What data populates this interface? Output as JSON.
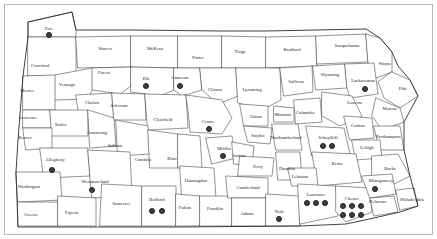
{
  "map": {
    "title": "Pennsylvania County Map",
    "region": "Pennsylvania",
    "dot_color": "#3f3f3f",
    "border_color": "#3a3a3a",
    "background_color": "#ffffff",
    "frame_color": "#b8b8b8",
    "label_color": "#1a1a1a"
  },
  "legend": {
    "dot_meaning": "site marker"
  },
  "chart_data": {
    "type": "map",
    "marker_symbol": "filled-circle",
    "total_markers": 23,
    "counties": [
      {
        "name": "Erie",
        "label_x": 49,
        "label_y": 28,
        "dots": 1
      },
      {
        "name": "Crawford",
        "label_x": 40,
        "label_y": 65,
        "dots": 0
      },
      {
        "name": "Warren",
        "label_x": 105,
        "label_y": 48,
        "dots": 0
      },
      {
        "name": "McKean",
        "label_x": 155,
        "label_y": 48,
        "dots": 0
      },
      {
        "name": "Potter",
        "label_x": 198,
        "label_y": 57,
        "dots": 0
      },
      {
        "name": "Tioga",
        "label_x": 240,
        "label_y": 51,
        "dots": 0
      },
      {
        "name": "Bradford",
        "label_x": 292,
        "label_y": 49,
        "dots": 0
      },
      {
        "name": "Susquehanna",
        "label_x": 347,
        "label_y": 45,
        "dots": 0
      },
      {
        "name": "Wayne",
        "label_x": 385,
        "label_y": 63,
        "dots": 0
      },
      {
        "name": "Mercer",
        "label_x": 27,
        "label_y": 90,
        "dots": 0
      },
      {
        "name": "Venango",
        "label_x": 67,
        "label_y": 84,
        "dots": 0
      },
      {
        "name": "Forest",
        "label_x": 104,
        "label_y": 72,
        "dots": 0
      },
      {
        "name": "Elk",
        "label_x": 146,
        "label_y": 78,
        "dots": 1
      },
      {
        "name": "Cameron",
        "label_x": 180,
        "label_y": 77,
        "dots": 1
      },
      {
        "name": "Clinton",
        "label_x": 215,
        "label_y": 89,
        "dots": 0
      },
      {
        "name": "Lycoming",
        "label_x": 252,
        "label_y": 89,
        "dots": 0
      },
      {
        "name": "Sullivan",
        "label_x": 296,
        "label_y": 81,
        "dots": 0
      },
      {
        "name": "Wyoming",
        "label_x": 330,
        "label_y": 74,
        "dots": 0
      },
      {
        "name": "Lackawanna",
        "label_x": 363,
        "label_y": 80,
        "dots": 1
      },
      {
        "name": "Pike",
        "label_x": 403,
        "label_y": 88,
        "dots": 0
      },
      {
        "name": "Lawrence",
        "label_x": 28,
        "label_y": 117,
        "dots": 0
      },
      {
        "name": "Clarion",
        "label_x": 92,
        "label_y": 102,
        "dots": 0
      },
      {
        "name": "Jefferson",
        "label_x": 119,
        "label_y": 105,
        "dots": 0
      },
      {
        "name": "Clearfield",
        "label_x": 163,
        "label_y": 119,
        "dots": 0
      },
      {
        "name": "Centre",
        "label_x": 208,
        "label_y": 121,
        "dots": 1
      },
      {
        "name": "Union",
        "label_x": 256,
        "label_y": 116,
        "dots": 0
      },
      {
        "name": "Montour",
        "label_x": 283,
        "label_y": 114,
        "dots": 0
      },
      {
        "name": "Columbia",
        "label_x": 305,
        "label_y": 112,
        "dots": 0
      },
      {
        "name": "Luzerne",
        "label_x": 355,
        "label_y": 102,
        "dots": 0
      },
      {
        "name": "Monroe",
        "label_x": 390,
        "label_y": 108,
        "dots": 0
      },
      {
        "name": "Butler",
        "label_x": 61,
        "label_y": 124,
        "dots": 0
      },
      {
        "name": "Armstrong",
        "label_x": 97,
        "label_y": 132,
        "dots": 0
      },
      {
        "name": "Beaver",
        "label_x": 25,
        "label_y": 137,
        "dots": 0
      },
      {
        "name": "Indiana",
        "label_x": 115,
        "label_y": 145,
        "dots": 0
      },
      {
        "name": "Cambria",
        "label_x": 143,
        "label_y": 159,
        "dots": 0
      },
      {
        "name": "Blair",
        "label_x": 172,
        "label_y": 158,
        "dots": 0
      },
      {
        "name": "Mifflin",
        "label_x": 224,
        "label_y": 148,
        "dots": 1
      },
      {
        "name": "Juniata",
        "label_x": 239,
        "label_y": 155,
        "dots": 0
      },
      {
        "name": "Snyder",
        "label_x": 258,
        "label_y": 135,
        "dots": 0
      },
      {
        "name": "Northumberland",
        "label_x": 286,
        "label_y": 137,
        "dots": 0
      },
      {
        "name": "Schuylkill",
        "label_x": 328,
        "label_y": 137,
        "dots": 2
      },
      {
        "name": "Carbon",
        "label_x": 358,
        "label_y": 125,
        "dots": 0
      },
      {
        "name": "Northampton",
        "label_x": 388,
        "label_y": 136,
        "dots": 0
      },
      {
        "name": "Lehigh",
        "label_x": 367,
        "label_y": 147,
        "dots": 0
      },
      {
        "name": "Berks",
        "label_x": 337,
        "label_y": 163,
        "dots": 0
      },
      {
        "name": "Bucks",
        "label_x": 390,
        "label_y": 168,
        "dots": 0
      },
      {
        "name": "Allegheny",
        "label_x": 55,
        "label_y": 159,
        "dots": 1
      },
      {
        "name": "Westmoreland",
        "label_x": 95,
        "label_y": 181,
        "dots": 1
      },
      {
        "name": "Washington",
        "label_x": 29,
        "label_y": 186,
        "dots": 0
      },
      {
        "name": "Greene",
        "label_x": 31,
        "label_y": 214,
        "dots": 0
      },
      {
        "name": "Fayette",
        "label_x": 72,
        "label_y": 212,
        "dots": 0
      },
      {
        "name": "Somerset",
        "label_x": 121,
        "label_y": 203,
        "dots": 0
      },
      {
        "name": "Bedford",
        "label_x": 157,
        "label_y": 199,
        "dots": 2
      },
      {
        "name": "Huntingdon",
        "label_x": 196,
        "label_y": 180,
        "dots": 0
      },
      {
        "name": "Fulton",
        "label_x": 185,
        "label_y": 207,
        "dots": 0
      },
      {
        "name": "Franklin",
        "label_x": 215,
        "label_y": 208,
        "dots": 0
      },
      {
        "name": "Cumberland",
        "label_x": 248,
        "label_y": 187,
        "dots": 0
      },
      {
        "name": "Perry",
        "label_x": 258,
        "label_y": 166,
        "dots": 0
      },
      {
        "name": "Dauphin",
        "label_x": 287,
        "label_y": 168,
        "dots": 0
      },
      {
        "name": "Lebanon",
        "label_x": 300,
        "label_y": 176,
        "dots": 0
      },
      {
        "name": "Adams",
        "label_x": 247,
        "label_y": 213,
        "dots": 0
      },
      {
        "name": "York",
        "label_x": 279,
        "label_y": 211,
        "dots": 1
      },
      {
        "name": "Lancaster",
        "label_x": 316,
        "label_y": 194,
        "dots": 3
      },
      {
        "name": "Chester",
        "label_x": 352,
        "label_y": 198,
        "dots": 6
      },
      {
        "name": "Montgomery",
        "label_x": 381,
        "label_y": 180,
        "dots": 1
      },
      {
        "name": "Delaware",
        "label_x": 378,
        "label_y": 201,
        "dots": 0
      },
      {
        "name": "Philadelphia",
        "label_x": 412,
        "label_y": 199,
        "dots": 0
      }
    ],
    "markers": [
      {
        "county": "Erie",
        "x": 49,
        "y": 35
      },
      {
        "county": "Elk",
        "x": 146,
        "y": 86
      },
      {
        "county": "Cameron",
        "x": 180,
        "y": 86
      },
      {
        "county": "Lackawanna",
        "x": 365,
        "y": 89
      },
      {
        "county": "Centre",
        "x": 209,
        "y": 129
      },
      {
        "county": "Mifflin",
        "x": 223,
        "y": 156
      },
      {
        "county": "Schuylkill",
        "x": 323,
        "y": 146
      },
      {
        "county": "Schuylkill",
        "x": 332,
        "y": 146
      },
      {
        "county": "Allegheny",
        "x": 52,
        "y": 170
      },
      {
        "county": "Westmoreland",
        "x": 92,
        "y": 190
      },
      {
        "county": "Bedford",
        "x": 152,
        "y": 211
      },
      {
        "county": "Bedford",
        "x": 162,
        "y": 211
      },
      {
        "county": "Montgomery",
        "x": 375,
        "y": 189
      },
      {
        "county": "York",
        "x": 279,
        "y": 219
      },
      {
        "county": "Lancaster",
        "x": 307,
        "y": 203
      },
      {
        "county": "Lancaster",
        "x": 316,
        "y": 203
      },
      {
        "county": "Lancaster",
        "x": 325,
        "y": 203
      },
      {
        "county": "Chester",
        "x": 343,
        "y": 206
      },
      {
        "county": "Chester",
        "x": 352,
        "y": 206
      },
      {
        "county": "Chester",
        "x": 361,
        "y": 206
      },
      {
        "county": "Chester",
        "x": 343,
        "y": 215
      },
      {
        "county": "Chester",
        "x": 352,
        "y": 215
      },
      {
        "county": "Chester",
        "x": 361,
        "y": 215
      }
    ]
  }
}
